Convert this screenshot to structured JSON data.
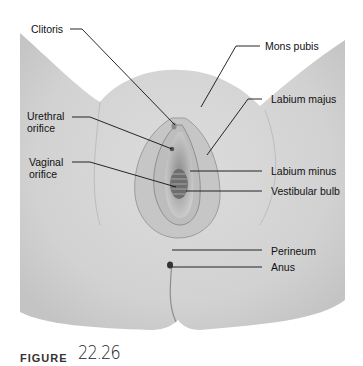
{
  "figure": {
    "caption_word": "Figure",
    "caption_number": "22.26"
  },
  "labels": {
    "clitoris": "Clitoris",
    "urethral_orifice_1": "Urethral",
    "urethral_orifice_2": "orifice",
    "vaginal_orifice_1": "Vaginal",
    "vaginal_orifice_2": "orifice",
    "mons_pubis": "Mons pubis",
    "labium_majus": "Labium majus",
    "labium_minus": "Labium minus",
    "vestibular_bulb": "Vestibular bulb",
    "perineum": "Perineum",
    "anus": "Anus"
  },
  "colors": {
    "skin_light": "#e2e2e2",
    "skin_mid": "#d0d0d0",
    "skin_dark": "#9a9a9a",
    "leader_line": "#111111",
    "background": "#ffffff"
  }
}
